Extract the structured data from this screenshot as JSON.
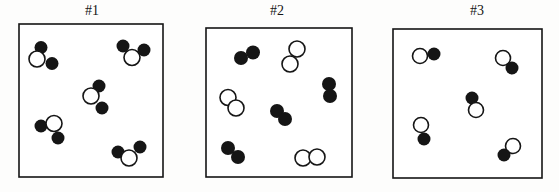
{
  "figure": {
    "width": 559,
    "height": 192
  },
  "colors": {
    "ink": "#151515",
    "open_fill": "#ffffff",
    "background": "#fdfdfc"
  },
  "stroke": {
    "box_width": 1.6,
    "atom_width": 1.6
  },
  "panels": [
    {
      "label": "#1",
      "label_x": 92,
      "label_y": 15,
      "box": {
        "x": 19,
        "y": 24,
        "w": 144,
        "h": 153
      },
      "molecules": [
        {
          "atoms": [
            {
              "kind": "filled",
              "x": 41,
              "y": 47.5,
              "r": 6.5
            },
            {
              "kind": "open",
              "x": 37,
              "y": 59,
              "r": 8
            },
            {
              "kind": "filled",
              "x": 52,
              "y": 63.5,
              "r": 6.5
            }
          ]
        },
        {
          "atoms": [
            {
              "kind": "filled",
              "x": 123,
              "y": 46,
              "r": 6.5
            },
            {
              "kind": "open",
              "x": 132,
              "y": 57.5,
              "r": 8
            },
            {
              "kind": "filled",
              "x": 144,
              "y": 50,
              "r": 6.5
            }
          ]
        },
        {
          "atoms": [
            {
              "kind": "filled",
              "x": 99,
              "y": 86,
              "r": 6.5
            },
            {
              "kind": "open",
              "x": 91,
              "y": 96,
              "r": 8
            },
            {
              "kind": "filled",
              "x": 102,
              "y": 108,
              "r": 6.5
            }
          ]
        },
        {
          "atoms": [
            {
              "kind": "filled",
              "x": 41,
              "y": 126,
              "r": 6.5
            },
            {
              "kind": "open",
              "x": 54,
              "y": 123.5,
              "r": 8
            },
            {
              "kind": "filled",
              "x": 58,
              "y": 138,
              "r": 6.5
            }
          ]
        },
        {
          "atoms": [
            {
              "kind": "filled",
              "x": 118,
              "y": 152,
              "r": 6.5
            },
            {
              "kind": "filled",
              "x": 140,
              "y": 147,
              "r": 6.5
            },
            {
              "kind": "open",
              "x": 129,
              "y": 158,
              "r": 8
            }
          ]
        }
      ]
    },
    {
      "label": "#2",
      "label_x": 277,
      "label_y": 15,
      "box": {
        "x": 206,
        "y": 28,
        "w": 146,
        "h": 149
      },
      "molecules": [
        {
          "atoms": [
            {
              "kind": "filled",
              "x": 241,
              "y": 58,
              "r": 7
            },
            {
              "kind": "filled",
              "x": 253,
              "y": 52.5,
              "r": 7
            }
          ]
        },
        {
          "atoms": [
            {
              "kind": "open",
              "x": 297,
              "y": 49,
              "r": 8
            },
            {
              "kind": "open",
              "x": 290,
              "y": 64,
              "r": 8
            }
          ]
        },
        {
          "atoms": [
            {
              "kind": "open",
              "x": 228,
              "y": 97.5,
              "r": 8
            },
            {
              "kind": "open",
              "x": 236,
              "y": 108,
              "r": 8
            }
          ]
        },
        {
          "atoms": [
            {
              "kind": "filled",
              "x": 277,
              "y": 111,
              "r": 7
            },
            {
              "kind": "filled",
              "x": 285,
              "y": 119,
              "r": 7
            }
          ]
        },
        {
          "atoms": [
            {
              "kind": "filled",
              "x": 329,
              "y": 84,
              "r": 7
            },
            {
              "kind": "filled",
              "x": 330,
              "y": 96,
              "r": 7
            }
          ]
        },
        {
          "atoms": [
            {
              "kind": "filled",
              "x": 228,
              "y": 148,
              "r": 7
            },
            {
              "kind": "filled",
              "x": 238,
              "y": 157,
              "r": 7
            }
          ]
        },
        {
          "atoms": [
            {
              "kind": "open",
              "x": 303,
              "y": 158,
              "r": 8
            },
            {
              "kind": "open",
              "x": 317,
              "y": 157,
              "r": 8
            }
          ]
        }
      ]
    },
    {
      "label": "#3",
      "label_x": 477,
      "label_y": 15,
      "box": {
        "x": 393,
        "y": 29,
        "w": 149,
        "h": 149
      },
      "molecules": [
        {
          "atoms": [
            {
              "kind": "open",
              "x": 420,
              "y": 56,
              "r": 7.5
            },
            {
              "kind": "filled",
              "x": 434,
              "y": 54,
              "r": 6.5
            }
          ]
        },
        {
          "atoms": [
            {
              "kind": "open",
              "x": 503,
              "y": 58,
              "r": 7.5
            },
            {
              "kind": "filled",
              "x": 512,
              "y": 68,
              "r": 6.5
            }
          ]
        },
        {
          "atoms": [
            {
              "kind": "filled",
              "x": 472,
              "y": 98,
              "r": 6.5
            },
            {
              "kind": "open",
              "x": 476,
              "y": 110,
              "r": 7.5
            }
          ]
        },
        {
          "atoms": [
            {
              "kind": "open",
              "x": 421,
              "y": 125,
              "r": 7.5
            },
            {
              "kind": "filled",
              "x": 424,
              "y": 139,
              "r": 6.5
            }
          ]
        },
        {
          "atoms": [
            {
              "kind": "open",
              "x": 513,
              "y": 146,
              "r": 7.5
            },
            {
              "kind": "filled",
              "x": 504,
              "y": 155,
              "r": 6.5
            }
          ]
        }
      ]
    }
  ]
}
